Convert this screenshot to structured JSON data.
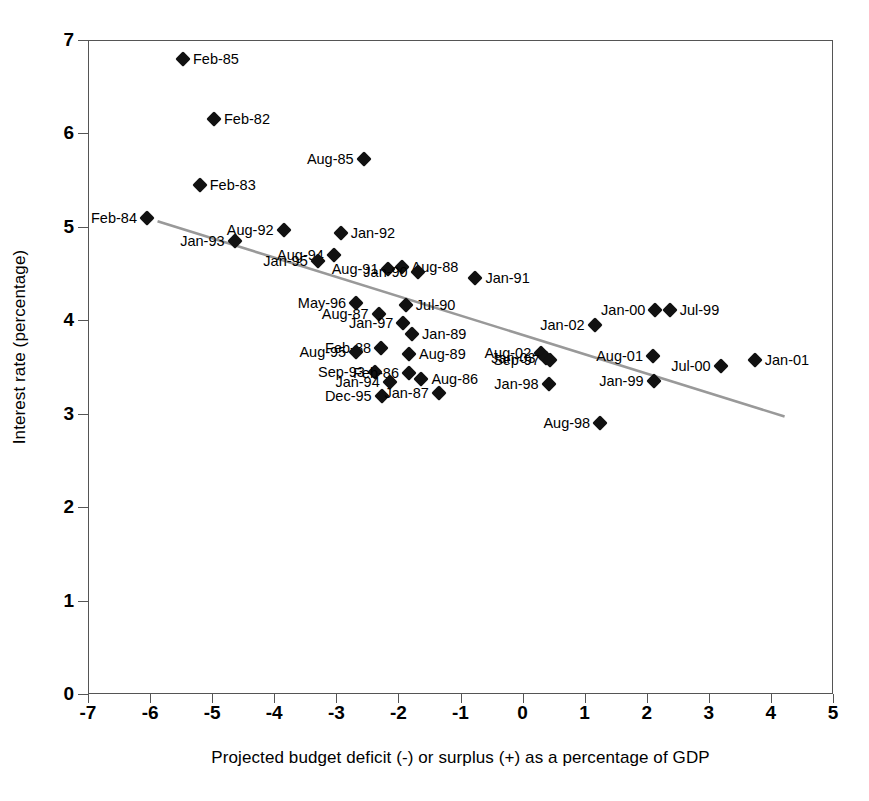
{
  "chart_data": {
    "type": "scatter",
    "title": "",
    "xlabel": "Projected budget deficit (-) or surplus (+) as a percentage of GDP",
    "ylabel": "Interest rate (percentage)",
    "xlim": [
      -7,
      5
    ],
    "ylim": [
      0,
      7
    ],
    "xticks": [
      "-7",
      "-6",
      "-5",
      "-4",
      "-3",
      "-2",
      "-1",
      "0",
      "1",
      "2",
      "3",
      "4",
      "5"
    ],
    "yticks": [
      "0",
      "1",
      "2",
      "3",
      "4",
      "5",
      "6",
      "7"
    ],
    "grid": false,
    "legend": "none",
    "marker_shape": "diamond",
    "marker_color": "#111111",
    "trend_line": {
      "color": "#999999",
      "x_start": -5.88,
      "y_start": 5.06,
      "x_end": 4.22,
      "y_end": 2.97
    },
    "points": [
      {
        "label": "Feb-85",
        "x": -5.47,
        "y": 6.8,
        "label_side": "right"
      },
      {
        "label": "Feb-82",
        "x": -4.97,
        "y": 6.15,
        "label_side": "right"
      },
      {
        "label": "Aug-85",
        "x": -2.56,
        "y": 5.73,
        "label_side": "left"
      },
      {
        "label": "Feb-83",
        "x": -5.2,
        "y": 5.45,
        "label_side": "right"
      },
      {
        "label": "Feb-84",
        "x": -6.05,
        "y": 5.09,
        "label_side": "left"
      },
      {
        "label": "Aug-92",
        "x": -3.85,
        "y": 4.97,
        "label_side": "left"
      },
      {
        "label": "Jan-92",
        "x": -2.93,
        "y": 4.93,
        "label_side": "right"
      },
      {
        "label": "Jan-93",
        "x": -4.64,
        "y": 4.85,
        "label_side": "left"
      },
      {
        "label": "Aug-94",
        "x": -3.04,
        "y": 4.7,
        "label_side": "left"
      },
      {
        "label": "Jan-95",
        "x": -3.3,
        "y": 4.63,
        "label_side": "left"
      },
      {
        "label": "Aug-88",
        "x": -1.95,
        "y": 4.57,
        "label_side": "right"
      },
      {
        "label": "Aug-91",
        "x": -2.16,
        "y": 4.55,
        "label_side": "left"
      },
      {
        "label": "Jan-90",
        "x": -1.69,
        "y": 4.52,
        "label_side": "left"
      },
      {
        "label": "Jan-91",
        "x": -0.76,
        "y": 4.45,
        "label_side": "right"
      },
      {
        "label": "May-96",
        "x": -2.68,
        "y": 4.18,
        "label_side": "left"
      },
      {
        "label": "Jul-90",
        "x": -1.88,
        "y": 4.16,
        "label_side": "right"
      },
      {
        "label": "Aug-87",
        "x": -2.32,
        "y": 4.07,
        "label_side": "left"
      },
      {
        "label": "Jan-00",
        "x": 2.14,
        "y": 4.11,
        "label_side": "left"
      },
      {
        "label": "Jul-99",
        "x": 2.37,
        "y": 4.11,
        "label_side": "right"
      },
      {
        "label": "Jan-97",
        "x": -1.92,
        "y": 3.97,
        "label_side": "left"
      },
      {
        "label": "Jan-02",
        "x": 1.16,
        "y": 3.95,
        "label_side": "left"
      },
      {
        "label": "Jan-89",
        "x": -1.78,
        "y": 3.85,
        "label_side": "right"
      },
      {
        "label": "Feb-88",
        "x": -2.28,
        "y": 3.7,
        "label_side": "left"
      },
      {
        "label": "Aug-95",
        "x": -2.68,
        "y": 3.66,
        "label_side": "left"
      },
      {
        "label": "Aug-89",
        "x": -1.83,
        "y": 3.64,
        "label_side": "right"
      },
      {
        "label": "Aug-02",
        "x": 0.3,
        "y": 3.65,
        "label_side": "left"
      },
      {
        "label": "Jan-03",
        "x": 0.37,
        "y": 3.6,
        "label_side": "left"
      },
      {
        "label": "Aug-01",
        "x": 2.1,
        "y": 3.62,
        "label_side": "left"
      },
      {
        "label": "Sep-97",
        "x": 0.44,
        "y": 3.58,
        "label_side": "left"
      },
      {
        "label": "Jul-00",
        "x": 3.19,
        "y": 3.51,
        "label_side": "left"
      },
      {
        "label": "Jan-01",
        "x": 3.74,
        "y": 3.57,
        "label_side": "right"
      },
      {
        "label": "Sep-93",
        "x": -2.38,
        "y": 3.45,
        "label_side": "left"
      },
      {
        "label": "Feb-86",
        "x": -1.83,
        "y": 3.44,
        "label_side": "left"
      },
      {
        "label": "Aug-86",
        "x": -1.63,
        "y": 3.37,
        "label_side": "right"
      },
      {
        "label": "Jan-94",
        "x": -2.14,
        "y": 3.34,
        "label_side": "left"
      },
      {
        "label": "Jan-98",
        "x": 0.42,
        "y": 3.32,
        "label_side": "left"
      },
      {
        "label": "Jan-99",
        "x": 2.11,
        "y": 3.35,
        "label_side": "left"
      },
      {
        "label": "Dec-95",
        "x": -2.27,
        "y": 3.19,
        "label_side": "left"
      },
      {
        "label": "Jan-87",
        "x": -1.35,
        "y": 3.22,
        "label_side": "left"
      },
      {
        "label": "Aug-98",
        "x": 1.25,
        "y": 2.9,
        "label_side": "left"
      }
    ]
  }
}
